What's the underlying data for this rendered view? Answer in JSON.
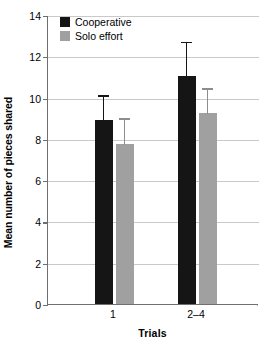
{
  "chart_data": {
    "type": "bar",
    "title": "",
    "xlabel": "Trials",
    "ylabel": "Mean number of pieces shared",
    "categories": [
      "1",
      "2–4"
    ],
    "ylim": [
      0,
      14
    ],
    "yticks": [
      0,
      2,
      4,
      6,
      8,
      10,
      12,
      14
    ],
    "ytick_labels": [
      "0",
      "2",
      "4",
      "6",
      "8",
      "10",
      "12",
      "14"
    ],
    "grid": true,
    "legend_position": "top-left",
    "series": [
      {
        "name": "Cooperative",
        "color": "#151515",
        "values": [
          8.9,
          11.05
        ],
        "errors_upper": [
          10.15,
          12.75
        ],
        "errors_lower": [
          8.9,
          11.05
        ]
      },
      {
        "name": "Solo effort",
        "color": "#a0a0a0",
        "values": [
          7.75,
          9.25
        ],
        "errors_upper": [
          9.05,
          10.5
        ],
        "errors_lower": [
          7.75,
          9.25
        ]
      }
    ]
  },
  "legend": {
    "items": [
      {
        "label": "Cooperative",
        "swatch": "cooperative"
      },
      {
        "label": "Solo effort",
        "swatch": "solo"
      }
    ]
  },
  "axes": {
    "y_title": "Mean number of pieces shared",
    "x_title": "Trials"
  }
}
